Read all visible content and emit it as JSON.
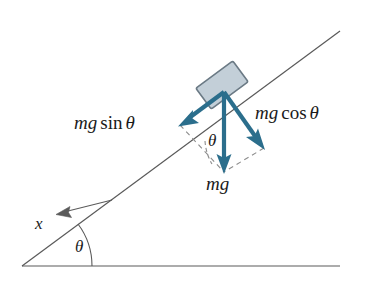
{
  "figure": {
    "type": "free-body-diagram",
    "background_color": "#ffffff"
  },
  "colors": {
    "force_arrow": "#2b6e8c",
    "block_fill": "#c3cfd8",
    "block_stroke": "#6b7a85",
    "line_stroke": "#5a5a5a",
    "dashed_stroke": "#8c8c8c",
    "text": "#1a1a1a"
  },
  "geometry": {
    "incline_angle_deg": 37,
    "baseline": {
      "x1": 22,
      "y1": 266,
      "x2": 340,
      "y2": 266
    },
    "incline_line": {
      "x1": 22,
      "y1": 266,
      "x2": 340,
      "y2": 31
    },
    "block": {
      "center_x": 222,
      "center_y": 85,
      "width": 46,
      "height": 26,
      "rotation_deg": -36.5
    }
  },
  "labels": {
    "mg_sin_theta": {
      "mg": "mg",
      "func": "sin",
      "theta": "θ"
    },
    "mg_cos_theta": {
      "mg": "mg",
      "func": "cos",
      "theta": "θ"
    },
    "mg": "mg",
    "theta_at_block": "θ",
    "theta_at_base": "θ",
    "x_axis": "x"
  },
  "vectors": [
    {
      "name": "mg-sin-theta-vector",
      "label": "mg sin θ",
      "description": "component of weight parallel to incline, pointing down-slope",
      "from": {
        "x": 224,
        "y": 92
      },
      "to": {
        "x": 180,
        "y": 125
      },
      "color": "#2b6e8c"
    },
    {
      "name": "mg-cos-theta-vector",
      "label": "mg cos θ",
      "description": "component of weight perpendicular to incline, pointing into the surface",
      "from": {
        "x": 224,
        "y": 92
      },
      "to": {
        "x": 264,
        "y": 148
      },
      "color": "#2b6e8c"
    },
    {
      "name": "mg-vector",
      "label": "mg",
      "description": "weight of the block, pointing vertically downward",
      "from": {
        "x": 224,
        "y": 92
      },
      "to": {
        "x": 224,
        "y": 172
      },
      "color": "#2b6e8c"
    },
    {
      "name": "x-axis-vector",
      "label": "x",
      "description": "positive x direction along the incline, pointing down-slope",
      "from": {
        "x": 112,
        "y": 200
      },
      "to": {
        "x": 56,
        "y": 214
      },
      "color": "#5a5a5a"
    }
  ]
}
